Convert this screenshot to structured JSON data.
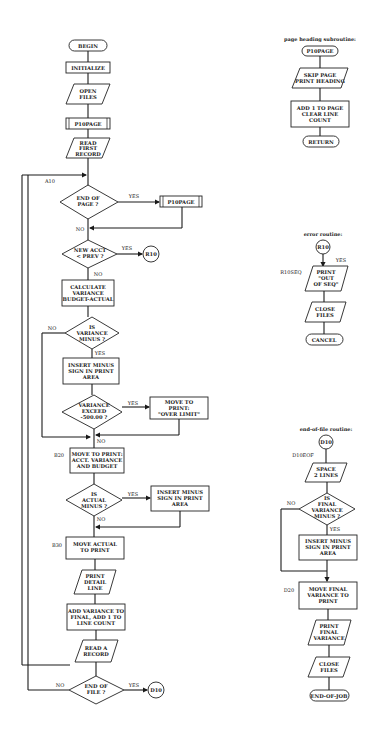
{
  "main": {
    "begin": "BEGIN",
    "initialize": "INITIALIZE",
    "open_files": [
      "OPEN",
      "FILES"
    ],
    "p10page_1": "P10PAGE",
    "read_first": [
      "READ",
      "FIRST",
      "RECORD"
    ],
    "label_a10": "A10",
    "end_of_page": [
      "END OF",
      "PAGE ?"
    ],
    "p10page_2": "P10PAGE",
    "new_acct": [
      "NEW ACCT",
      "< PREV ?"
    ],
    "r10_connector": "R10",
    "calc_variance": [
      "CALCULATE",
      "VARIANCE",
      "BUDGET-ACTUAL"
    ],
    "is_variance_minus": [
      "IS",
      "VARIANCE",
      "MINUS ?"
    ],
    "insert_minus_1": [
      "INSERT MINUS",
      "SIGN IN PRINT",
      "AREA"
    ],
    "variance_exceed": [
      "VARIANCE",
      "EXCEED",
      "-500.00 ?"
    ],
    "over_limit": [
      "MOVE TO",
      "PRINT:",
      "\"OVER LIMIT\""
    ],
    "label_b20": "B20",
    "move_to_print": [
      "MOVE TO PRINT:",
      "ACCT. VARIANCE",
      "AND BUDGET"
    ],
    "is_actual_minus": [
      "IS",
      "ACTUAL",
      "MINUS ?"
    ],
    "insert_minus_2": [
      "INSERT MINUS",
      "SIGN IN PRINT",
      "AREA"
    ],
    "label_b30": "B30",
    "move_actual": [
      "MOVE ACTUAL",
      "TO PRINT"
    ],
    "print_detail": [
      "PRINT",
      "DETAIL",
      "LINE"
    ],
    "add_variance": [
      "ADD VARIANCE TO",
      "FINAL, ADD 1 TO",
      "LINE COUNT"
    ],
    "read_record": [
      "READ A",
      "RECORD"
    ],
    "end_of_file": [
      "END OF",
      "FILE ?"
    ],
    "d10_connector": "D10"
  },
  "labels": {
    "yes": "YES",
    "no": "NO"
  },
  "page_heading": {
    "title": "page heading subroutine:",
    "start": "P10PAGE",
    "skip_page": [
      "SKIP PAGE",
      "PRINT HEADING"
    ],
    "add_page": [
      "ADD 1 TO PAGE",
      "CLEAR LINE",
      "COUNT"
    ],
    "end": "RETURN"
  },
  "error_routine": {
    "title": "error routine:",
    "connector": "R10",
    "label": "R10SEQ",
    "print_out_of_seq": [
      "PRINT",
      "\"OUT",
      "OF SEQ\""
    ],
    "close_files": [
      "CLOSE",
      "FILES"
    ],
    "end": "CANCEL"
  },
  "eof_routine": {
    "title": "end-of-file routine:",
    "connector": "D10",
    "label": "D10EOF",
    "space_lines": [
      "SPACE",
      "2 LINES"
    ],
    "is_final_minus": [
      "IS",
      "FINAL",
      "VARIANCE",
      "MINUS ?"
    ],
    "insert_minus": [
      "INSERT MINUS",
      "SIGN IN PRINT",
      "AREA"
    ],
    "label_d20": "D20",
    "move_final": [
      "MOVE FINAL",
      "VARIANCE TO",
      "PRINT"
    ],
    "print_final": [
      "PRINT",
      "FINAL",
      "VARIANCE"
    ],
    "close_files": [
      "CLOSE",
      "FILES"
    ],
    "end": "END-OF-JOB"
  }
}
